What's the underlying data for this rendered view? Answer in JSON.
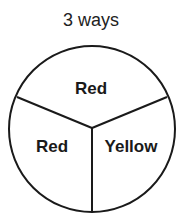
{
  "title": "3 ways",
  "spinner": {
    "sections": [
      {
        "label": "Red",
        "share": 0.3333
      },
      {
        "label": "Yellow",
        "share": 0.3333
      },
      {
        "label": "Red",
        "share": 0.3333
      }
    ]
  }
}
